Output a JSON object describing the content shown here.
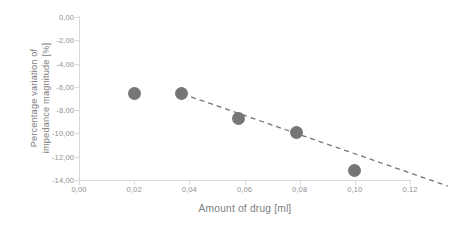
{
  "chart_data": {
    "type": "scatter",
    "title": "",
    "xlabel": "Amount of drug [ml]",
    "ylabel": "Percentage variation of\nimpedance magnitude [%]",
    "xlim": [
      0.0,
      0.12
    ],
    "ylim": [
      -14.0,
      0.0
    ],
    "grid": false,
    "legend": false,
    "decimal_separator": ",",
    "marker_color": "#767676",
    "trendline_color": "#767676",
    "axis_color": "#d9d9d9",
    "tick_label_color": "#909090",
    "axis_title_color": "#808080",
    "x": [
      0.02,
      0.037,
      0.058,
      0.079,
      0.1
    ],
    "y": [
      -6.55,
      -6.6,
      -8.75,
      -9.9,
      -13.2
    ],
    "points": [
      {
        "x": 0.02,
        "y": -6.55
      },
      {
        "x": 0.037,
        "y": -6.6
      },
      {
        "x": 0.058,
        "y": -8.75
      },
      {
        "x": 0.079,
        "y": -9.9
      },
      {
        "x": 0.1,
        "y": -13.2
      }
    ],
    "xticks": [
      0.0,
      0.02,
      0.04,
      0.06,
      0.08,
      0.1,
      0.12
    ],
    "yticks": [
      0.0,
      -2.0,
      -4.0,
      -6.0,
      -8.0,
      -10.0,
      -12.0,
      -14.0
    ],
    "xticklabels": [
      "0,00",
      "0,02",
      "0,04",
      "0,06",
      "0,08",
      "0,10",
      "0,12"
    ],
    "yticklabels": [
      "0,00",
      "-2,00",
      "-4,00",
      "-6,00",
      "-8,00",
      "-10,00",
      "-12,00",
      "-14,00"
    ],
    "trendline": {
      "type": "linear",
      "style": "dashed",
      "x_start": 0.012,
      "y_start": -5.4,
      "x_end": 0.1,
      "y_end": -12.96
    }
  }
}
